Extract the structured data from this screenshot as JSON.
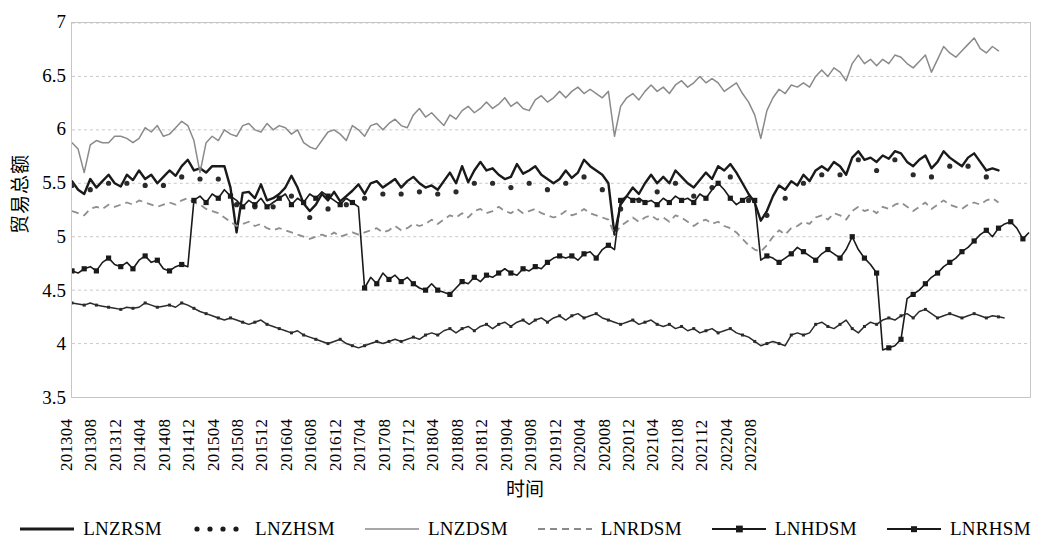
{
  "chart_data": {
    "type": "line",
    "title": "",
    "xlabel": "时间",
    "ylabel": "贸易总额",
    "ylim": [
      3.5,
      7
    ],
    "yticks": [
      3.5,
      4,
      4.5,
      5,
      5.5,
      6,
      6.5,
      7
    ],
    "grid": true,
    "legend_position": "bottom",
    "x_start": "201304",
    "x_end": "202209",
    "x_tick_step_months": 4,
    "xtick_labels": [
      "201304",
      "201308",
      "201312",
      "201404",
      "201408",
      "201412",
      "201504",
      "201508",
      "201512",
      "201604",
      "201608",
      "201612",
      "201704",
      "201708",
      "201712",
      "201804",
      "201808",
      "201812",
      "201904",
      "201908",
      "201912",
      "202004",
      "202008",
      "202012",
      "202104",
      "202108",
      "202112",
      "202204",
      "202208"
    ],
    "series": [
      {
        "name": "LNZRSM",
        "style": "solid-thick-black",
        "color": "#1a1a1a",
        "values": [
          5.52,
          5.44,
          5.4,
          5.54,
          5.46,
          5.52,
          5.58,
          5.5,
          5.47,
          5.58,
          5.53,
          5.62,
          5.54,
          5.58,
          5.5,
          5.56,
          5.62,
          5.57,
          5.66,
          5.72,
          5.62,
          5.64,
          5.6,
          5.66,
          5.66,
          5.66,
          5.46,
          5.04,
          5.41,
          5.42,
          5.36,
          5.49,
          5.34,
          5.36,
          5.4,
          5.46,
          5.57,
          5.46,
          5.31,
          5.24,
          5.3,
          5.4,
          5.34,
          5.42,
          5.33,
          5.38,
          5.43,
          5.49,
          5.4,
          5.5,
          5.52,
          5.46,
          5.5,
          5.54,
          5.46,
          5.52,
          5.56,
          5.5,
          5.46,
          5.48,
          5.44,
          5.52,
          5.6,
          5.5,
          5.66,
          5.51,
          5.62,
          5.7,
          5.62,
          5.64,
          5.58,
          5.54,
          5.56,
          5.68,
          5.59,
          5.62,
          5.66,
          5.58,
          5.54,
          5.5,
          5.54,
          5.62,
          5.55,
          5.6,
          5.72,
          5.66,
          5.62,
          5.58,
          5.5,
          5.02,
          5.3,
          5.38,
          5.46,
          5.4,
          5.5,
          5.58,
          5.5,
          5.56,
          5.5,
          5.62,
          5.56,
          5.5,
          5.46,
          5.53,
          5.6,
          5.54,
          5.66,
          5.62,
          5.68,
          5.6,
          5.5,
          5.4,
          5.32,
          5.15,
          5.24,
          5.38,
          5.48,
          5.44,
          5.52,
          5.48,
          5.58,
          5.52,
          5.62,
          5.66,
          5.62,
          5.7,
          5.66,
          5.58,
          5.74,
          5.8,
          5.72,
          5.74,
          5.7,
          5.76,
          5.73,
          5.8,
          5.78,
          5.7,
          5.66,
          5.72,
          5.76,
          5.64,
          5.7,
          5.8,
          5.74,
          5.7,
          5.66,
          5.74,
          5.78,
          5.7,
          5.62,
          5.64,
          5.62
        ]
      },
      {
        "name": "LNZHSM",
        "style": "dotted-black",
        "color": "#2b2b2b",
        "values": [
          5.48,
          5.36,
          5.3,
          5.44,
          5.42,
          5.48,
          5.5,
          5.46,
          5.44,
          5.5,
          5.46,
          5.5,
          5.48,
          5.5,
          5.44,
          5.48,
          5.52,
          5.5,
          5.56,
          5.58,
          5.52,
          5.54,
          5.5,
          5.52,
          5.54,
          5.54,
          5.38,
          5.3,
          5.32,
          5.36,
          5.28,
          5.34,
          5.26,
          5.28,
          5.3,
          5.34,
          5.38,
          5.34,
          5.24,
          5.18,
          5.22,
          5.3,
          5.26,
          5.32,
          5.28,
          5.3,
          5.34,
          5.38,
          5.36,
          5.42,
          5.44,
          5.4,
          5.44,
          5.46,
          5.4,
          5.44,
          5.46,
          5.42,
          5.4,
          5.42,
          5.4,
          5.44,
          5.48,
          5.42,
          5.52,
          5.44,
          5.5,
          5.54,
          5.48,
          5.5,
          5.46,
          5.44,
          5.46,
          5.52,
          5.48,
          5.5,
          5.52,
          5.46,
          5.44,
          5.42,
          5.44,
          5.5,
          5.44,
          5.48,
          5.56,
          5.52,
          5.48,
          5.44,
          5.4,
          5.14,
          5.26,
          5.32,
          5.38,
          5.34,
          5.42,
          5.48,
          5.42,
          5.46,
          5.42,
          5.5,
          5.46,
          5.42,
          5.38,
          5.44,
          5.5,
          5.46,
          5.54,
          5.5,
          5.56,
          5.5,
          5.42,
          5.34,
          5.26,
          5.12,
          5.2,
          5.32,
          5.4,
          5.36,
          5.44,
          5.4,
          5.5,
          5.44,
          5.54,
          5.58,
          5.54,
          5.62,
          5.58,
          5.5,
          5.66,
          5.72,
          5.64,
          5.66,
          5.62,
          5.68,
          5.65,
          5.72,
          5.7,
          5.62,
          5.58,
          5.64,
          5.68,
          5.56,
          5.62,
          5.72,
          5.66,
          5.62,
          5.58,
          5.66,
          5.7,
          5.62,
          5.56,
          5.58,
          5.56
        ]
      },
      {
        "name": "LNZDSM",
        "style": "solid-thin-gray",
        "color": "#8a8a8a",
        "values": [
          5.88,
          5.82,
          5.6,
          5.86,
          5.9,
          5.88,
          5.88,
          5.94,
          5.94,
          5.92,
          5.88,
          5.92,
          6.02,
          5.98,
          6.04,
          5.94,
          5.96,
          6.02,
          6.08,
          6.04,
          5.9,
          5.6,
          5.88,
          5.94,
          5.9,
          6.0,
          5.96,
          5.94,
          6.04,
          6.06,
          6.0,
          5.98,
          6.06,
          6.0,
          6.04,
          6.02,
          5.96,
          6.0,
          5.88,
          5.84,
          5.82,
          5.9,
          5.98,
          6.0,
          5.96,
          5.9,
          6.04,
          6.0,
          5.94,
          6.04,
          6.06,
          6.0,
          6.06,
          6.1,
          6.04,
          6.02,
          6.14,
          6.2,
          6.12,
          6.16,
          6.1,
          6.04,
          6.14,
          6.1,
          6.18,
          6.22,
          6.16,
          6.2,
          6.26,
          6.2,
          6.24,
          6.3,
          6.22,
          6.26,
          6.2,
          6.18,
          6.28,
          6.32,
          6.26,
          6.3,
          6.36,
          6.3,
          6.36,
          6.4,
          6.34,
          6.38,
          6.34,
          6.3,
          6.36,
          5.94,
          6.22,
          6.3,
          6.34,
          6.28,
          6.36,
          6.42,
          6.36,
          6.4,
          6.34,
          6.42,
          6.46,
          6.4,
          6.44,
          6.5,
          6.44,
          6.48,
          6.44,
          6.36,
          6.4,
          6.44,
          6.34,
          6.26,
          6.14,
          5.92,
          6.18,
          6.3,
          6.38,
          6.34,
          6.42,
          6.4,
          6.44,
          6.4,
          6.5,
          6.56,
          6.5,
          6.58,
          6.54,
          6.46,
          6.62,
          6.7,
          6.62,
          6.66,
          6.6,
          6.66,
          6.62,
          6.7,
          6.68,
          6.62,
          6.58,
          6.64,
          6.7,
          6.54,
          6.66,
          6.78,
          6.72,
          6.68,
          6.74,
          6.8,
          6.86,
          6.76,
          6.72,
          6.78,
          6.74
        ]
      },
      {
        "name": "LNRDSM",
        "style": "dashed-gray",
        "color": "#8e8e8e",
        "values": [
          5.24,
          5.22,
          5.2,
          5.26,
          5.28,
          5.26,
          5.3,
          5.28,
          5.3,
          5.32,
          5.3,
          5.34,
          5.32,
          5.3,
          5.28,
          5.3,
          5.32,
          5.3,
          5.34,
          5.36,
          5.32,
          5.3,
          5.26,
          5.24,
          5.22,
          5.18,
          5.14,
          5.1,
          5.12,
          5.14,
          5.1,
          5.12,
          5.08,
          5.06,
          5.08,
          5.06,
          5.04,
          5.02,
          5.0,
          4.98,
          5.0,
          5.02,
          5.0,
          5.04,
          5.0,
          5.02,
          5.04,
          5.02,
          5.04,
          5.06,
          5.08,
          5.04,
          5.06,
          5.1,
          5.06,
          5.08,
          5.12,
          5.1,
          5.12,
          5.16,
          5.12,
          5.16,
          5.2,
          5.18,
          5.22,
          5.18,
          5.24,
          5.26,
          5.22,
          5.24,
          5.28,
          5.24,
          5.22,
          5.26,
          5.22,
          5.24,
          5.26,
          5.22,
          5.2,
          5.18,
          5.2,
          5.24,
          5.2,
          5.22,
          5.26,
          5.22,
          5.2,
          5.18,
          5.16,
          5.02,
          5.1,
          5.14,
          5.18,
          5.14,
          5.18,
          5.2,
          5.16,
          5.18,
          5.14,
          5.2,
          5.18,
          5.14,
          5.1,
          5.14,
          5.16,
          5.12,
          5.14,
          5.1,
          5.08,
          5.04,
          4.98,
          4.92,
          4.88,
          4.86,
          4.92,
          5.0,
          5.06,
          5.02,
          5.08,
          5.1,
          5.14,
          5.12,
          5.18,
          5.2,
          5.16,
          5.22,
          5.2,
          5.16,
          5.24,
          5.28,
          5.24,
          5.26,
          5.22,
          5.28,
          5.26,
          5.3,
          5.32,
          5.28,
          5.24,
          5.28,
          5.32,
          5.26,
          5.3,
          5.34,
          5.3,
          5.28,
          5.26,
          5.3,
          5.32,
          5.3,
          5.34,
          5.36,
          5.32
        ]
      },
      {
        "name": "LNHDSM",
        "style": "square-marker-black",
        "color": "#1a1a1a",
        "values": [
          4.68,
          4.66,
          4.7,
          4.72,
          4.68,
          4.76,
          4.8,
          4.74,
          4.72,
          4.76,
          4.7,
          4.78,
          4.82,
          4.76,
          4.78,
          4.7,
          4.68,
          4.72,
          4.74,
          4.72,
          5.34,
          5.38,
          5.32,
          5.4,
          5.36,
          5.44,
          5.38,
          5.34,
          5.28,
          5.34,
          5.3,
          5.36,
          5.28,
          5.32,
          5.36,
          5.4,
          5.3,
          5.36,
          5.32,
          5.4,
          5.36,
          5.42,
          5.38,
          5.34,
          5.3,
          5.36,
          5.32,
          5.28,
          4.52,
          4.62,
          4.56,
          4.66,
          4.6,
          4.64,
          4.58,
          4.62,
          4.56,
          4.52,
          4.5,
          4.56,
          4.5,
          4.48,
          4.46,
          4.52,
          4.58,
          4.56,
          4.62,
          4.58,
          4.64,
          4.62,
          4.66,
          4.7,
          4.66,
          4.64,
          4.7,
          4.68,
          4.72,
          4.7,
          4.76,
          4.8,
          4.82,
          4.8,
          4.82,
          4.78,
          4.84,
          4.86,
          4.8,
          4.88,
          4.92,
          4.88,
          5.34,
          5.38,
          5.34,
          5.36,
          5.32,
          5.34,
          5.3,
          5.36,
          5.32,
          5.38,
          5.34,
          5.36,
          5.32,
          5.4,
          5.36,
          5.44,
          5.5,
          5.44,
          5.36,
          5.3,
          5.34,
          5.38,
          5.34,
          4.78,
          4.82,
          4.8,
          4.76,
          4.8,
          4.84,
          4.9,
          4.86,
          4.82,
          4.78,
          4.84,
          4.88,
          4.84,
          4.8,
          4.88,
          5.0,
          4.88,
          4.8,
          4.74,
          4.66,
          3.94,
          3.96,
          3.98,
          4.04,
          4.42,
          4.46,
          4.5,
          4.56,
          4.62,
          4.66,
          4.72,
          4.76,
          4.8,
          4.86,
          4.9,
          4.96,
          5.02,
          5.06,
          5.0,
          5.08,
          5.12,
          5.14,
          5.08,
          4.98,
          5.04
        ]
      },
      {
        "name": "LNRHSM",
        "style": "square-marker-thin",
        "color": "#2b2b2b",
        "values": [
          4.38,
          4.37,
          4.36,
          4.38,
          4.36,
          4.35,
          4.34,
          4.33,
          4.32,
          4.34,
          4.33,
          4.34,
          4.38,
          4.36,
          4.34,
          4.35,
          4.36,
          4.34,
          4.38,
          4.36,
          4.33,
          4.3,
          4.28,
          4.26,
          4.24,
          4.22,
          4.24,
          4.22,
          4.2,
          4.18,
          4.2,
          4.22,
          4.18,
          4.16,
          4.14,
          4.12,
          4.1,
          4.12,
          4.08,
          4.06,
          4.04,
          4.02,
          4.0,
          4.02,
          4.04,
          4.0,
          3.98,
          3.96,
          3.98,
          4.0,
          4.02,
          4.0,
          4.02,
          4.04,
          4.02,
          4.04,
          4.06,
          4.04,
          4.08,
          4.1,
          4.08,
          4.12,
          4.14,
          4.1,
          4.14,
          4.16,
          4.12,
          4.16,
          4.18,
          4.14,
          4.18,
          4.2,
          4.16,
          4.2,
          4.22,
          4.18,
          4.22,
          4.24,
          4.2,
          4.24,
          4.26,
          4.22,
          4.26,
          4.28,
          4.24,
          4.26,
          4.28,
          4.24,
          4.22,
          4.2,
          4.18,
          4.2,
          4.22,
          4.18,
          4.2,
          4.22,
          4.18,
          4.16,
          4.18,
          4.14,
          4.16,
          4.12,
          4.14,
          4.1,
          4.12,
          4.14,
          4.1,
          4.12,
          4.14,
          4.1,
          4.08,
          4.06,
          4.02,
          3.98,
          4.0,
          4.02,
          4.0,
          3.98,
          4.08,
          4.1,
          4.08,
          4.1,
          4.18,
          4.2,
          4.16,
          4.14,
          4.18,
          4.22,
          4.14,
          4.1,
          4.16,
          4.2,
          4.18,
          4.22,
          4.24,
          4.22,
          4.26,
          4.28,
          4.24,
          4.3,
          4.32,
          4.28,
          4.24,
          4.26,
          4.28,
          4.26,
          4.24,
          4.26,
          4.28,
          4.26,
          4.24,
          4.26,
          4.25,
          4.24
        ]
      }
    ]
  },
  "legend": {
    "items": [
      {
        "label": "LNZRSM",
        "key": "solid-thick-black"
      },
      {
        "label": "LNZHSM",
        "key": "dotted-black"
      },
      {
        "label": "LNZDSM",
        "key": "solid-thin-gray"
      },
      {
        "label": "LNRDSM",
        "key": "dashed-gray"
      },
      {
        "label": "LNHDSM",
        "key": "square-marker-black"
      },
      {
        "label": "LNRHSM",
        "key": "square-marker-thin"
      }
    ]
  },
  "colors": {
    "grid": "#c9c9c9",
    "plot_border": "#c6c6c6",
    "axis_text": "#000000",
    "gray_series": "#8a8a8a",
    "black_series": "#1a1a1a"
  }
}
